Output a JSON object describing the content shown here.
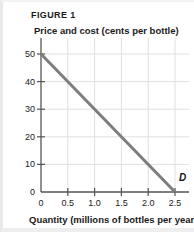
{
  "figure": {
    "label": "FIGURE 1",
    "y_axis_title": "Price and cost (cents per bottle)",
    "x_axis_title": "Quantity (millions of bottles per year)"
  },
  "chart_data": {
    "type": "line",
    "title": "FIGURE 1",
    "xlabel": "Quantity (millions of bottles per year)",
    "ylabel": "Price and cost (cents per bottle)",
    "xlim": [
      0,
      2.6
    ],
    "ylim": [
      0,
      55
    ],
    "grid": true,
    "legend_position": "inline-end-of-line",
    "x_ticks": [
      "0",
      "0.5",
      "1.0",
      "1.5",
      "2.0",
      "2.5"
    ],
    "x_tick_values": [
      0,
      0.5,
      1.0,
      1.5,
      2.0,
      2.5
    ],
    "y_ticks": [
      "0",
      "10",
      "20",
      "30",
      "40",
      "50"
    ],
    "y_tick_values": [
      0,
      10,
      20,
      30,
      40,
      50
    ],
    "series": [
      {
        "name": "D",
        "annotation": "D",
        "color": "#7d7d7d",
        "x": [
          0,
          2.5
        ],
        "values": [
          50,
          0
        ],
        "points": [
          [
            0,
            50
          ],
          [
            2.5,
            0
          ]
        ]
      }
    ]
  },
  "colors": {
    "demand_line": "#7d7d7d",
    "axis": "#555555",
    "grid": "#e0e0e0",
    "text": "#1a1a1a",
    "background": "#ffffff"
  }
}
